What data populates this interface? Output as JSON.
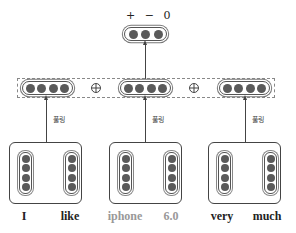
{
  "diagram": {
    "type": "sentence-cnn-pooling",
    "output": {
      "label": "+ − 0",
      "classes": [
        "+",
        "−",
        "0"
      ],
      "units": 3
    },
    "concat": {
      "operator_symbol": "⊕",
      "pooled_vectors": [
        {
          "units": 4
        },
        {
          "units": 4
        },
        {
          "units": 4
        }
      ]
    },
    "pool_label": "풀링",
    "groups": [
      {
        "words": [
          {
            "text": "I",
            "style": "bold"
          },
          {
            "text": "like",
            "style": "bold"
          }
        ],
        "units_per_word": 4
      },
      {
        "words": [
          {
            "text": "iphone",
            "style": "light"
          },
          {
            "text": "6.0",
            "style": "light"
          }
        ],
        "units_per_word": 4
      },
      {
        "words": [
          {
            "text": "very",
            "style": "bold"
          },
          {
            "text": "much",
            "style": "bold"
          }
        ],
        "units_per_word": 4
      }
    ],
    "colors": {
      "node_fill": "#5a5a5a",
      "stroke": "#444444",
      "dashed": "#888888",
      "light_text": "#999999",
      "text": "#222222"
    }
  }
}
